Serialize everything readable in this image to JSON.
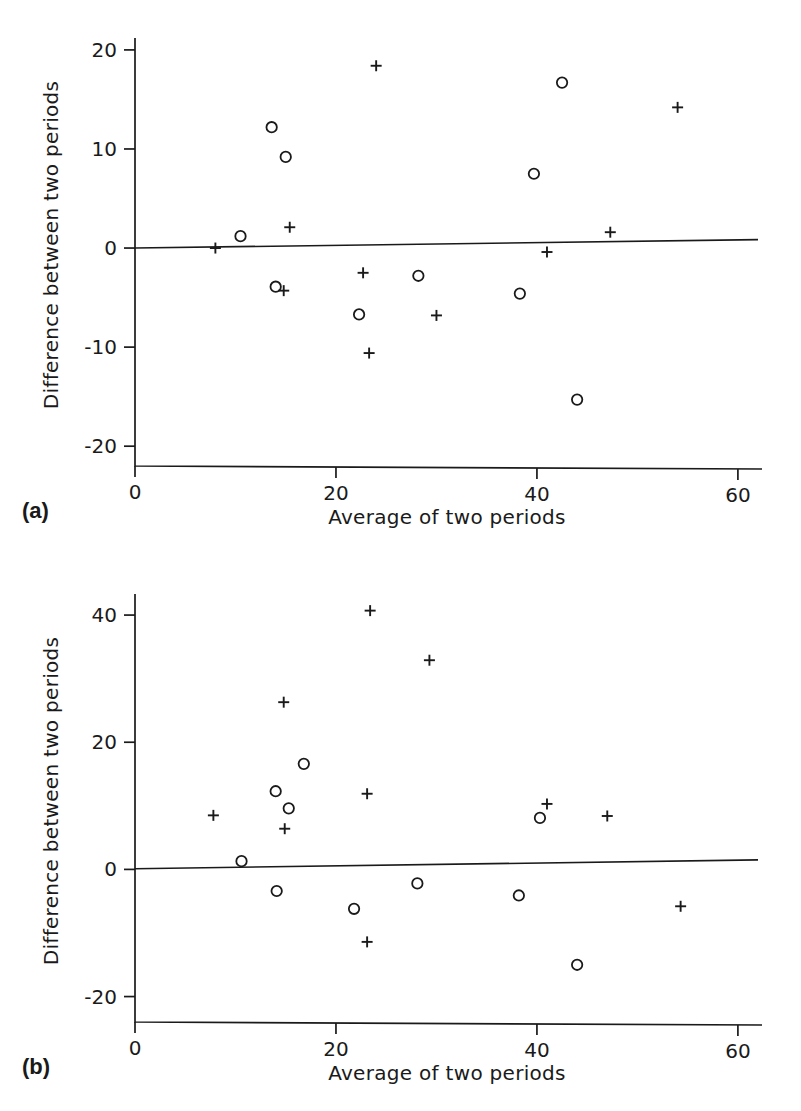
{
  "figure": {
    "type": "bland-altman-scatter-pair",
    "background": "#ffffff",
    "ink_color": "#1a1a1a"
  },
  "panels": [
    {
      "tag": "(a)",
      "xlabel": "Average of two periods",
      "ylabel": "Difference between two periods",
      "xticks": [
        "0",
        "20",
        "40",
        "60"
      ],
      "yticks": [
        "20",
        "10",
        "0",
        "-10",
        "-20"
      ]
    },
    {
      "tag": "(b)",
      "xlabel": "Average of two periods",
      "ylabel": "Difference between two periods",
      "xticks": [
        "0",
        "20",
        "40",
        "60"
      ],
      "yticks": [
        "40",
        "20",
        "0",
        "-20"
      ]
    }
  ],
  "chart_data": [
    {
      "type": "scatter",
      "panel": "(a)",
      "title": "",
      "xlabel": "Average of two periods",
      "ylabel": "Difference between two periods",
      "xlim": [
        0,
        62
      ],
      "ylim": [
        -22,
        21
      ],
      "xticks": [
        0,
        20,
        40,
        60
      ],
      "yticks": [
        20,
        10,
        0,
        -10,
        -20
      ],
      "grid": false,
      "legend": null,
      "series": [
        {
          "name": "circle-marker",
          "marker": "circle",
          "points": [
            {
              "x": 10.5,
              "y": 1.2
            },
            {
              "x": 13.6,
              "y": 12.2
            },
            {
              "x": 15.0,
              "y": 9.2
            },
            {
              "x": 14.0,
              "y": -3.9
            },
            {
              "x": 22.3,
              "y": -6.7
            },
            {
              "x": 28.2,
              "y": -2.8
            },
            {
              "x": 38.3,
              "y": -4.6
            },
            {
              "x": 39.7,
              "y": 7.5
            },
            {
              "x": 42.5,
              "y": 16.7
            },
            {
              "x": 44.0,
              "y": -15.3
            }
          ]
        },
        {
          "name": "plus-marker",
          "marker": "plus",
          "points": [
            {
              "x": 8.0,
              "y": 0.0
            },
            {
              "x": 15.4,
              "y": 2.1
            },
            {
              "x": 14.8,
              "y": -4.3
            },
            {
              "x": 22.7,
              "y": -2.5
            },
            {
              "x": 24.0,
              "y": 18.4
            },
            {
              "x": 23.3,
              "y": -10.6
            },
            {
              "x": 30.0,
              "y": -6.8
            },
            {
              "x": 41.0,
              "y": -0.4
            },
            {
              "x": 47.3,
              "y": 1.6
            },
            {
              "x": 54.0,
              "y": 14.2
            }
          ]
        }
      ],
      "reference_line": {
        "name": "regression-line",
        "x_start": 0.0,
        "y_start": 0.0,
        "x_end": 62.0,
        "y_end": 0.85
      }
    },
    {
      "type": "scatter",
      "panel": "(b)",
      "title": "",
      "xlabel": "Average of two periods",
      "ylabel": "Difference between two periods",
      "xlim": [
        0,
        62
      ],
      "ylim": [
        -24,
        43
      ],
      "xticks": [
        0,
        20,
        40,
        60
      ],
      "yticks": [
        40,
        20,
        0,
        -20
      ],
      "grid": false,
      "legend": null,
      "series": [
        {
          "name": "circle-marker",
          "marker": "circle",
          "points": [
            {
              "x": 10.6,
              "y": 1.3
            },
            {
              "x": 14.0,
              "y": 12.3
            },
            {
              "x": 15.3,
              "y": 9.6
            },
            {
              "x": 16.8,
              "y": 16.6
            },
            {
              "x": 14.1,
              "y": -3.4
            },
            {
              "x": 21.8,
              "y": -6.2
            },
            {
              "x": 28.1,
              "y": -2.2
            },
            {
              "x": 38.2,
              "y": -4.1
            },
            {
              "x": 40.3,
              "y": 8.1
            },
            {
              "x": 44.0,
              "y": -15.0
            }
          ]
        },
        {
          "name": "plus-marker",
          "marker": "plus",
          "points": [
            {
              "x": 7.8,
              "y": 8.5
            },
            {
              "x": 14.8,
              "y": 26.3
            },
            {
              "x": 14.9,
              "y": 6.4
            },
            {
              "x": 23.1,
              "y": 11.9
            },
            {
              "x": 23.4,
              "y": 40.7
            },
            {
              "x": 23.1,
              "y": -11.4
            },
            {
              "x": 29.3,
              "y": 32.9
            },
            {
              "x": 41.0,
              "y": 10.3
            },
            {
              "x": 47.0,
              "y": 8.4
            },
            {
              "x": 54.3,
              "y": -5.8
            }
          ]
        }
      ],
      "reference_line": {
        "name": "regression-line",
        "x_start": 0.0,
        "y_start": 0.1,
        "x_end": 62.0,
        "y_end": 1.5
      }
    }
  ]
}
